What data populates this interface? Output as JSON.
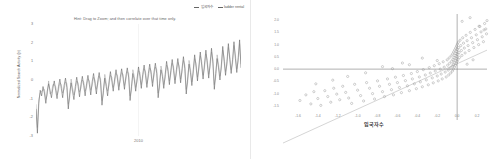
{
  "timeseries_panel": {
    "legend": [
      {
        "label": "입국자수",
        "color": "#555555",
        "icon": "line-swatch"
      },
      {
        "label": "ladder rental",
        "color": "#777777",
        "icon": "line-swatch"
      }
    ],
    "hint": "Hint: Drag to Zoom; and then correlate over that time only.",
    "ylabel": "Normalized Search Activity (σ)",
    "xlabel": "",
    "yticks": [
      "3",
      "2",
      "1",
      "0",
      "-1",
      "-2",
      "-3"
    ],
    "xticks": [
      "2010"
    ]
  },
  "scatter_panel": {
    "ylabel": "ladder rental",
    "xlabel": "입국자수",
    "yticks": [
      "2.0",
      "1.5",
      "1.0",
      "0.5",
      "0.0",
      "-0.5",
      "-1.0",
      "-1.5"
    ],
    "xticks": [
      "-1.6",
      "-1.4",
      "-1.2",
      "-1.0",
      "-0.8",
      "-0.6",
      "-0.4",
      "-0.2",
      "0.0",
      "0.2"
    ]
  },
  "chart_data": [
    {
      "type": "line",
      "title": "",
      "xlabel": "",
      "ylabel": "Normalized Search Activity (σ)",
      "xlim": [
        0,
        144
      ],
      "ylim": [
        -3,
        3
      ],
      "grid": false,
      "legend_position": "top-right",
      "annotations": [
        "Hint: Drag to Zoom; and then correlate over that time only."
      ],
      "xticks": [
        "2010"
      ],
      "yticks": [
        3,
        2,
        1,
        0,
        -1,
        -2,
        -3
      ],
      "series": [
        {
          "name": "입국자수",
          "color": "#555555",
          "values": [
            -1.55,
            -2.85,
            -1.25,
            -0.55,
            -0.85,
            -0.35,
            -0.7,
            -1.25,
            -0.6,
            -0.2,
            -0.55,
            -0.95,
            -0.45,
            -0.05,
            -0.55,
            -1.0,
            -0.35,
            0.05,
            -0.45,
            -0.95,
            -0.3,
            0.1,
            -0.4,
            -1.55,
            -0.75,
            -0.15,
            -0.6,
            -1.05,
            -0.35,
            0.15,
            -0.35,
            -0.9,
            -0.25,
            0.2,
            -0.3,
            -0.85,
            -0.2,
            0.25,
            -0.25,
            -0.8,
            -0.1,
            0.35,
            -0.2,
            -0.75,
            -0.05,
            0.4,
            -0.15,
            -1.35,
            -0.55,
            0.1,
            -0.35,
            -0.85,
            -0.1,
            0.45,
            -0.05,
            -0.6,
            0.05,
            0.55,
            0.05,
            -0.55,
            0.15,
            0.6,
            0.1,
            -0.5,
            0.2,
            0.65,
            0.15,
            -1.1,
            -0.35,
            0.35,
            0.0,
            -0.6,
            0.1,
            0.7,
            0.2,
            -0.45,
            0.3,
            0.8,
            0.25,
            -0.4,
            0.35,
            0.85,
            0.3,
            -0.35,
            0.4,
            0.9,
            0.35,
            -0.95,
            -0.2,
            0.55,
            0.2,
            -0.45,
            0.3,
            1.0,
            0.45,
            -0.25,
            0.5,
            1.1,
            0.5,
            -0.2,
            0.55,
            1.15,
            0.55,
            -0.15,
            0.6,
            1.25,
            0.6,
            -0.75,
            0.05,
            0.85,
            0.4,
            -0.3,
            0.55,
            1.35,
            0.7,
            -0.05,
            0.75,
            1.5,
            0.8,
            0.05,
            0.85,
            1.6,
            0.85,
            0.1,
            0.9,
            1.7,
            0.9,
            -0.5,
            0.35,
            1.15,
            0.65,
            0.0,
            0.8,
            1.8,
            1.0,
            0.25,
            1.0,
            1.95,
            1.1,
            0.35,
            1.1,
            2.05,
            1.15,
            0.4,
            1.2,
            2.15,
            0.65
          ]
        },
        {
          "name": "ladder rental",
          "color": "#777777",
          "values": [
            -1.3,
            -2.55,
            -1.05,
            -0.7,
            -0.6,
            -0.55,
            -0.5,
            -1.05,
            -0.8,
            -0.05,
            -0.75,
            -0.7,
            -0.25,
            -0.25,
            -0.35,
            -0.8,
            -0.55,
            -0.15,
            -0.25,
            -0.7,
            -0.5,
            -0.1,
            -0.2,
            -1.3,
            -0.95,
            0.05,
            -0.4,
            -0.8,
            -0.55,
            -0.05,
            -0.15,
            -0.65,
            -0.45,
            0.0,
            -0.1,
            -0.6,
            -0.4,
            0.05,
            -0.05,
            -0.55,
            -0.3,
            0.15,
            0.0,
            -0.5,
            -0.25,
            0.2,
            0.05,
            -1.1,
            -0.75,
            0.3,
            -0.15,
            -0.6,
            -0.3,
            0.25,
            0.15,
            -0.4,
            -0.15,
            0.35,
            0.25,
            -0.35,
            -0.05,
            0.4,
            0.3,
            -0.3,
            0.0,
            0.45,
            0.35,
            -0.85,
            -0.55,
            0.55,
            0.2,
            -0.4,
            -0.1,
            0.5,
            0.4,
            -0.25,
            0.1,
            0.6,
            0.45,
            -0.2,
            0.15,
            0.65,
            0.5,
            -0.15,
            0.2,
            0.7,
            0.55,
            -0.7,
            -0.4,
            0.75,
            0.4,
            -0.25,
            0.1,
            0.8,
            0.65,
            -0.05,
            0.3,
            0.9,
            0.7,
            0.0,
            0.35,
            0.95,
            0.75,
            0.05,
            0.4,
            1.05,
            0.8,
            -0.5,
            -0.15,
            1.05,
            0.6,
            -0.1,
            0.35,
            1.15,
            0.9,
            0.15,
            0.55,
            1.3,
            1.0,
            0.25,
            0.65,
            1.4,
            1.05,
            0.3,
            0.7,
            1.5,
            1.1,
            -0.25,
            0.15,
            1.35,
            0.85,
            0.2,
            0.6,
            1.6,
            1.2,
            0.45,
            0.8,
            1.75,
            1.3,
            0.55,
            0.9,
            1.85,
            1.35,
            0.6,
            1.0,
            1.95,
            0.85
          ]
        }
      ]
    },
    {
      "type": "scatter",
      "title": "",
      "xlabel": "입국자수",
      "ylabel": "ladder rental",
      "xlim": [
        -1.75,
        0.3
      ],
      "ylim": [
        -1.75,
        2.25
      ],
      "grid": false,
      "legend_position": "none",
      "trendline": {
        "type": "linear",
        "slope": 1.85,
        "intercept": 0.22,
        "color": "#b8b8b8"
      },
      "xticks": [
        -1.6,
        -1.4,
        -1.2,
        -1.0,
        -0.8,
        -0.6,
        -0.4,
        -0.2,
        0.0,
        0.2
      ],
      "yticks": [
        2.0,
        1.5,
        1.0,
        0.5,
        0.0,
        -0.5,
        -1.0,
        -1.5
      ],
      "marker": "open-circle",
      "marker_color": "#8a8a8a",
      "points": [
        [
          -1.58,
          -1.28
        ],
        [
          -1.52,
          -1.05
        ],
        [
          -1.47,
          -1.42
        ],
        [
          -1.44,
          -0.92
        ],
        [
          -1.4,
          -1.2
        ],
        [
          -1.37,
          -1.48
        ],
        [
          -1.33,
          -0.88
        ],
        [
          -1.3,
          -1.12
        ],
        [
          -1.27,
          -1.35
        ],
        [
          -1.24,
          -0.78
        ],
        [
          -1.21,
          -1.02
        ],
        [
          -1.18,
          -1.25
        ],
        [
          -1.15,
          -0.7
        ],
        [
          -1.12,
          -0.95
        ],
        [
          -1.09,
          -1.18
        ],
        [
          -1.06,
          -1.4
        ],
        [
          -1.03,
          -0.62
        ],
        [
          -1.0,
          -0.86
        ],
        [
          -0.97,
          -1.08
        ],
        [
          -0.94,
          -1.3
        ],
        [
          -0.91,
          -0.55
        ],
        [
          -0.88,
          -0.78
        ],
        [
          -0.85,
          -1.0
        ],
        [
          -0.83,
          -1.22
        ],
        [
          -0.8,
          -0.48
        ],
        [
          -0.78,
          -0.7
        ],
        [
          -0.75,
          -0.92
        ],
        [
          -0.73,
          -1.12
        ],
        [
          -0.7,
          -0.4
        ],
        [
          -0.68,
          -0.62
        ],
        [
          -0.66,
          -0.84
        ],
        [
          -0.64,
          -1.05
        ],
        [
          -0.62,
          -0.33
        ],
        [
          -0.6,
          -0.55
        ],
        [
          -0.58,
          -0.75
        ],
        [
          -0.56,
          -0.96
        ],
        [
          -0.54,
          -0.26
        ],
        [
          -0.52,
          -0.47
        ],
        [
          -0.5,
          -0.68
        ],
        [
          -0.48,
          -0.88
        ],
        [
          -0.46,
          -0.18
        ],
        [
          -0.45,
          -0.4
        ],
        [
          -0.43,
          -0.6
        ],
        [
          -0.41,
          -0.8
        ],
        [
          -0.4,
          -0.1
        ],
        [
          -0.38,
          -0.32
        ],
        [
          -0.37,
          -0.52
        ],
        [
          -0.35,
          -0.72
        ],
        [
          -0.34,
          -0.02
        ],
        [
          -0.32,
          -0.24
        ],
        [
          -0.31,
          -0.44
        ],
        [
          -0.29,
          -0.64
        ],
        [
          -0.28,
          0.06
        ],
        [
          -0.27,
          -0.16
        ],
        [
          -0.25,
          -0.36
        ],
        [
          -0.24,
          -0.56
        ],
        [
          -0.23,
          0.14
        ],
        [
          -0.22,
          -0.08
        ],
        [
          -0.2,
          -0.28
        ],
        [
          -0.19,
          -0.48
        ],
        [
          -0.18,
          0.22
        ],
        [
          -0.17,
          0.0
        ],
        [
          -0.16,
          -0.2
        ],
        [
          -0.15,
          -0.4
        ],
        [
          -0.14,
          0.3
        ],
        [
          -0.13,
          0.08
        ],
        [
          -0.12,
          -0.12
        ],
        [
          -0.11,
          -0.32
        ],
        [
          -0.1,
          0.38
        ],
        [
          -0.095,
          0.16
        ],
        [
          -0.09,
          -0.04
        ],
        [
          -0.085,
          -0.24
        ],
        [
          -0.08,
          0.46
        ],
        [
          -0.075,
          0.24
        ],
        [
          -0.07,
          0.04
        ],
        [
          -0.065,
          -0.16
        ],
        [
          -0.06,
          0.54
        ],
        [
          -0.055,
          0.32
        ],
        [
          -0.05,
          0.12
        ],
        [
          -0.048,
          -0.08
        ],
        [
          -0.045,
          0.62
        ],
        [
          -0.042,
          0.4
        ],
        [
          -0.04,
          0.2
        ],
        [
          -0.038,
          0.0
        ],
        [
          -0.035,
          0.7
        ],
        [
          -0.032,
          0.48
        ],
        [
          -0.03,
          0.28
        ],
        [
          -0.028,
          0.08
        ],
        [
          -0.025,
          0.78
        ],
        [
          -0.022,
          0.56
        ],
        [
          -0.02,
          0.36
        ],
        [
          -0.018,
          0.16
        ],
        [
          -0.015,
          0.86
        ],
        [
          -0.012,
          0.64
        ],
        [
          -0.01,
          0.44
        ],
        [
          -0.008,
          0.24
        ],
        [
          -0.006,
          0.94
        ],
        [
          -0.004,
          0.72
        ],
        [
          -0.002,
          0.52
        ],
        [
          0.0,
          0.32
        ],
        [
          0.002,
          1.02
        ],
        [
          0.004,
          0.8
        ],
        [
          0.006,
          0.6
        ],
        [
          0.008,
          0.4
        ],
        [
          0.012,
          1.1
        ],
        [
          0.016,
          0.88
        ],
        [
          0.02,
          0.68
        ],
        [
          0.024,
          0.48
        ],
        [
          0.03,
          1.18
        ],
        [
          0.036,
          0.96
        ],
        [
          0.042,
          0.76
        ],
        [
          0.048,
          0.56
        ],
        [
          0.056,
          1.28
        ],
        [
          0.064,
          1.06
        ],
        [
          0.072,
          0.86
        ],
        [
          0.08,
          0.66
        ],
        [
          0.09,
          1.38
        ],
        [
          0.1,
          1.16
        ],
        [
          0.11,
          0.96
        ],
        [
          0.12,
          0.76
        ],
        [
          0.132,
          1.5
        ],
        [
          0.144,
          1.28
        ],
        [
          0.156,
          1.08
        ],
        [
          0.168,
          0.88
        ],
        [
          0.18,
          1.62
        ],
        [
          0.192,
          1.4
        ],
        [
          0.204,
          1.2
        ],
        [
          0.216,
          1.0
        ],
        [
          0.228,
          1.74
        ],
        [
          0.24,
          1.52
        ],
        [
          0.252,
          1.32
        ],
        [
          0.264,
          1.12
        ],
        [
          0.276,
          1.86
        ],
        [
          0.288,
          1.64
        ],
        [
          0.295,
          1.44
        ],
        [
          0.3,
          1.98
        ],
        [
          -1.1,
          -0.3
        ],
        [
          -0.92,
          -0.15
        ],
        [
          -0.75,
          0.1
        ],
        [
          -0.55,
          0.25
        ],
        [
          -0.35,
          0.45
        ],
        [
          -0.2,
          0.35
        ],
        [
          0.05,
          1.95
        ],
        [
          0.13,
          2.1
        ],
        [
          0.22,
          1.75
        ],
        [
          0.27,
          1.6
        ],
        [
          -0.48,
          0.18
        ],
        [
          -0.65,
          0.02
        ],
        [
          -1.25,
          -0.45
        ],
        [
          -1.42,
          -0.6
        ],
        [
          0.1,
          0.2
        ],
        [
          0.16,
          0.38
        ]
      ]
    }
  ]
}
